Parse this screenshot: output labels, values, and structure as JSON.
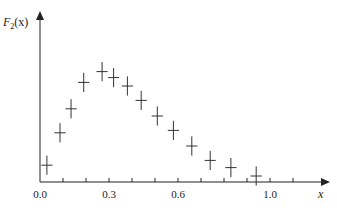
{
  "chart_data": {
    "type": "scatter",
    "title": "",
    "xlabel": "x",
    "ylabel": "F2(x)",
    "ylabel_parts": {
      "main": "F",
      "sub": "2",
      "arg": "(x)"
    },
    "x_ticks": [
      0.0,
      0.1,
      0.2,
      0.3,
      0.4,
      0.5,
      0.6,
      0.7,
      0.8,
      0.9,
      1.0,
      1.1
    ],
    "x_tick_labels": [
      {
        "value": 0.0,
        "label": "0.0"
      },
      {
        "value": 0.3,
        "label": "0.3"
      },
      {
        "value": 0.6,
        "label": "0.6"
      },
      {
        "value": 1.0,
        "label": "1.0"
      }
    ],
    "xlim": [
      0.0,
      1.23
    ],
    "ylim": [
      0.0,
      1.0
    ],
    "y_ticks": [],
    "grid": false,
    "legend": null,
    "marker": "error-cross",
    "series": [
      {
        "name": "F2(x) data",
        "x": [
          0.03,
          0.087,
          0.135,
          0.19,
          0.27,
          0.32,
          0.38,
          0.44,
          0.51,
          0.58,
          0.66,
          0.74,
          0.83,
          0.94
        ],
        "y": [
          0.14,
          0.41,
          0.61,
          0.83,
          0.92,
          0.87,
          0.8,
          0.68,
          0.55,
          0.43,
          0.3,
          0.18,
          0.12,
          0.05
        ],
        "x_err": [
          0.02,
          0.02,
          0.02,
          0.02,
          0.02,
          0.02,
          0.02,
          0.02,
          0.02,
          0.02,
          0.02,
          0.02,
          0.02,
          0.02
        ],
        "y_err": [
          0.08,
          0.08,
          0.08,
          0.08,
          0.08,
          0.08,
          0.08,
          0.08,
          0.08,
          0.08,
          0.08,
          0.08,
          0.08,
          0.08
        ]
      }
    ]
  },
  "colors": {
    "axis": "#222222",
    "marker": "#333333",
    "background": "#ffffff"
  }
}
